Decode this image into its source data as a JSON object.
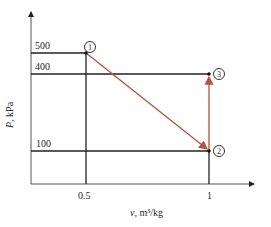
{
  "diagram": {
    "type": "P-v process diagram",
    "y_axis": {
      "label_symbol": "P",
      "label_unit": ", kPa",
      "ticks": [
        "500",
        "400",
        "100"
      ]
    },
    "x_axis": {
      "label_symbol": "v",
      "label_unit": ", m³/kg",
      "ticks": [
        "0.5",
        "1"
      ]
    },
    "states": [
      {
        "id": "1",
        "label": "①",
        "v": 0.5,
        "P": 500
      },
      {
        "id": "2",
        "label": "②",
        "v": 1,
        "P": 100
      },
      {
        "id": "3",
        "label": "③",
        "v": 1,
        "P": 400
      }
    ],
    "processes": [
      {
        "from": "1",
        "to": "2",
        "kind": "straight-line expansion"
      },
      {
        "from": "2",
        "to": "3",
        "kind": "constant-volume heating"
      }
    ],
    "colors": {
      "axis": "#333333",
      "guide": "#222222",
      "process": "#b5523a"
    }
  }
}
